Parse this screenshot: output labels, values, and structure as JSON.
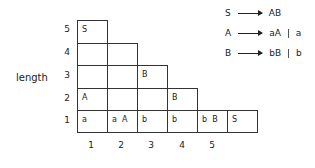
{
  "axis": {
    "y_label": "length",
    "row_labels": [
      "5",
      "4",
      "3",
      "2",
      "1"
    ],
    "col_labels": [
      "1",
      "2",
      "3",
      "4",
      "5"
    ]
  },
  "grid": {
    "row5": [
      "S"
    ],
    "row4": [
      "",
      ""
    ],
    "row3": [
      "",
      "",
      "B"
    ],
    "row2": [
      "A",
      "",
      "",
      "B"
    ],
    "row1": [
      "a",
      "a  A",
      "b",
      "b",
      "b  B",
      "S"
    ]
  },
  "grammar": [
    {
      "lhs": "S",
      "rhs": [
        "AB"
      ]
    },
    {
      "lhs": "A",
      "rhs": [
        "aA",
        "a"
      ]
    },
    {
      "lhs": "B",
      "rhs": [
        "bB",
        "b"
      ]
    }
  ]
}
